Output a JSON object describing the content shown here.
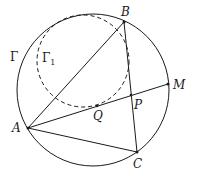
{
  "diagram": {
    "type": "geometry",
    "circles": [
      {
        "name": "Gamma",
        "label": "Γ",
        "style": "solid"
      },
      {
        "name": "Gamma1",
        "label": "Γ",
        "subscript": "1",
        "style": "dashed"
      }
    ],
    "points": {
      "A": {
        "label": "A"
      },
      "B": {
        "label": "B"
      },
      "C": {
        "label": "C"
      },
      "M": {
        "label": "M"
      },
      "P": {
        "label": "P"
      },
      "Q": {
        "label": "Q"
      }
    },
    "segments": [
      "AB",
      "BC",
      "CA",
      "AM"
    ],
    "colors": {
      "stroke": "#1a1a1a",
      "background": "#ffffff"
    }
  }
}
